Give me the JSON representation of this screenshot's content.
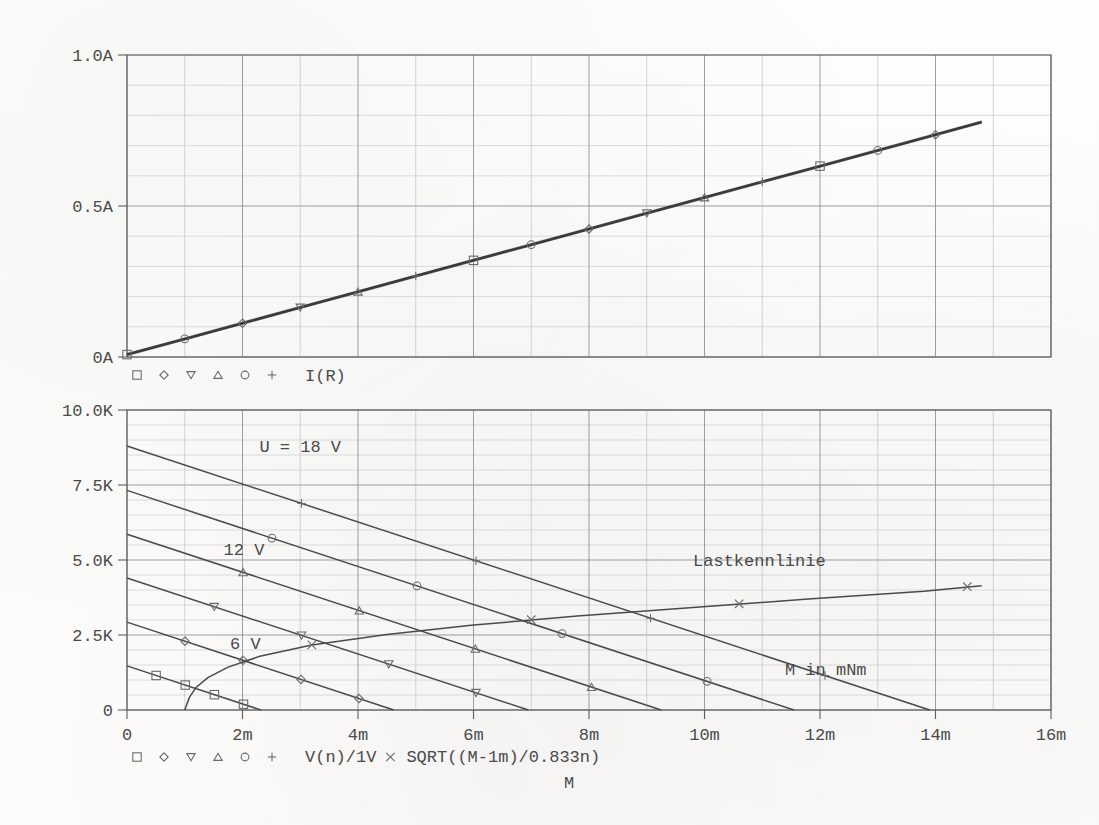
{
  "figure": {
    "title": "",
    "background": "#fdfdfb",
    "ink_color": "#4a4a4a",
    "grid_major_color": "#8d8d96",
    "grid_minor_color": "#b9b9c2"
  },
  "top_panel": {
    "y_ticks": [
      "0A",
      "0.5A",
      "1.0A"
    ],
    "legend": {
      "markers": [
        "square",
        "diamond",
        "triangle-down",
        "triangle-up",
        "circle",
        "plus"
      ],
      "label": "I(R)"
    }
  },
  "bottom_panel": {
    "y_ticks": [
      "0",
      "2.5K",
      "5.0K",
      "7.5K",
      "10.0K"
    ],
    "x_ticks": [
      "0",
      "2m",
      "4m",
      "6m",
      "8m",
      "10m",
      "12m",
      "14m",
      "16m"
    ],
    "x_axis_label": "M",
    "annotations": [
      {
        "text": "U = 18 V",
        "x": 6.0,
        "y": 8600
      },
      {
        "text": "12 V",
        "x": 4.05,
        "y": 5180
      },
      {
        "text": "6 V",
        "x": 4.1,
        "y": 2020
      },
      {
        "text": "Lastkennlinie",
        "x": 21.9,
        "y": 4800
      },
      {
        "text": "M in mNm",
        "x": 24.2,
        "y": 1180
      }
    ],
    "legend": {
      "markers": [
        "square",
        "diamond",
        "triangle-down",
        "triangle-up",
        "circle",
        "plus"
      ],
      "label": "V(n)/1V",
      "cross_marker": "cross",
      "cross_label": "SQRT((M-1m)/0.833n)"
    }
  },
  "chart_data": [
    {
      "type": "line",
      "id": "top-current-panel",
      "title": "",
      "xlabel": "M",
      "ylabel": "",
      "xlim": [
        0,
        0.016
      ],
      "ylim": [
        0,
        1.0
      ],
      "x_tick_labels": [
        "0",
        "2m",
        "4m",
        "6m",
        "8m",
        "10m",
        "12m",
        "14m",
        "16m"
      ],
      "x_tick_values": [
        0,
        0.002,
        0.004,
        0.006,
        0.008,
        0.01,
        0.012,
        0.014,
        0.016
      ],
      "y_tick_labels": [
        "0A",
        "0.5A",
        "1.0A"
      ],
      "y_tick_values": [
        0,
        0.5,
        1.0
      ],
      "y_minor_step": 0.1,
      "x_minor_step": 0.001,
      "grid": true,
      "legend_position": "below-left",
      "legend_entries": [
        "I(R)"
      ],
      "note": "All six traces (U = 3,6,9,12,15,18 V) are coincident: armature current depends only on torque.",
      "series": [
        {
          "name": "I(R)",
          "marker": "square",
          "x": [
            0,
            0.001,
            0.002,
            0.003,
            0.004,
            0.005,
            0.006,
            0.007,
            0.008,
            0.009,
            0.01,
            0.011,
            0.012,
            0.013,
            0.014,
            0.0148
          ],
          "y": [
            0.008,
            0.06,
            0.112,
            0.164,
            0.216,
            0.268,
            0.32,
            0.372,
            0.424,
            0.476,
            0.528,
            0.58,
            0.632,
            0.684,
            0.736,
            0.778
          ]
        }
      ]
    },
    {
      "type": "line",
      "id": "bottom-speed-panel",
      "title": "",
      "xlabel": "M",
      "ylabel": "",
      "xlim": [
        0,
        0.016
      ],
      "ylim": [
        0,
        10000
      ],
      "x_tick_labels": [
        "0",
        "2m",
        "4m",
        "6m",
        "8m",
        "10m",
        "12m",
        "14m",
        "16m"
      ],
      "x_tick_values": [
        0,
        0.002,
        0.004,
        0.006,
        0.008,
        0.01,
        0.012,
        0.014,
        0.016
      ],
      "y_tick_labels": [
        "0",
        "2.5K",
        "5.0K",
        "7.5K",
        "10.0K"
      ],
      "y_tick_values": [
        0,
        2500,
        5000,
        7500,
        10000
      ],
      "y_minor_step": 500,
      "x_minor_step": 0.001,
      "grid": true,
      "legend_position": "below-left",
      "legend_entries": [
        "V(n)/1V",
        "SQRT((M-1m)/0.833n)"
      ],
      "series": [
        {
          "name": "U = 18 V",
          "marker": "plus",
          "x": [
            0,
            0.0139
          ],
          "y": [
            8800,
            0
          ]
        },
        {
          "name": "U = 15 V",
          "marker": "circle",
          "x": [
            0,
            0.01155
          ],
          "y": [
            7320,
            0
          ]
        },
        {
          "name": "U = 12 V",
          "marker": "triangle-up",
          "x": [
            0,
            0.00925
          ],
          "y": [
            5860,
            0
          ]
        },
        {
          "name": "U = 9 V",
          "marker": "triangle-down",
          "x": [
            0,
            0.00695
          ],
          "y": [
            4400,
            0
          ]
        },
        {
          "name": "U = 6 V",
          "marker": "diamond",
          "x": [
            0,
            0.00462
          ],
          "y": [
            2930,
            0
          ]
        },
        {
          "name": "U = 3 V",
          "marker": "square",
          "x": [
            0,
            0.00232
          ],
          "y": [
            1470,
            0
          ]
        },
        {
          "name": "SQRT((M-1m)/0.833n)",
          "marker": "cross",
          "x": [
            0.001,
            0.00105,
            0.0011,
            0.0012,
            0.0014,
            0.0017,
            0.0021,
            0.0026,
            0.0032,
            0.004,
            0.005,
            0.0062,
            0.0076,
            0.0092,
            0.011,
            0.013,
            0.0148
          ],
          "y": [
            0,
            775,
            1096,
            1549,
            2191,
            2864,
            3464,
            4382,
            5083,
            5993,
            6928,
            7889,
            8888,
            9798,
            10000,
            10000,
            10000
          ]
        }
      ],
      "note": "The rising curve (Lastkennlinie / load characteristic) is clipped to the visible window; displayed segment spans about 1m..14.8m with values 0..4.2K in panel scale."
    }
  ]
}
